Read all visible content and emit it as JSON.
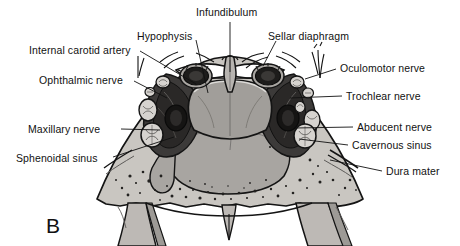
{
  "figure": {
    "panel_letter": "B",
    "colors": {
      "background": "#ffffff",
      "ink": "#111111",
      "bone_light": "#c9c6c1",
      "bone_mid": "#b2aeaa",
      "cavity_shade": "#9d9a96",
      "soft_tissue": "#8e8b88",
      "sinus_dark": "#3c3a39",
      "artery_dark": "#1d1c1b",
      "nerve_fill": "#d6d3cf"
    }
  },
  "labels": [
    {
      "id": "infundibulum",
      "text": "Infundibulum",
      "side": "top",
      "text_x": 196,
      "text_y": 6,
      "leader": [
        [
          230,
          22
        ],
        [
          230,
          72
        ]
      ]
    },
    {
      "id": "hypophysis",
      "text": "Hypophysis",
      "side": "top-left",
      "text_x": 137,
      "text_y": 30,
      "leader": [
        [
          196,
          40
        ],
        [
          208,
          93
        ]
      ]
    },
    {
      "id": "sellar-diaphragm",
      "text": "Sellar diaphragm",
      "side": "top-right",
      "text_x": 268,
      "text_y": 30,
      "leader": [
        [
          276,
          41
        ],
        [
          263,
          66
        ]
      ]
    },
    {
      "id": "internal-carotid-artery",
      "text": "Internal carotid artery",
      "side": "left",
      "text_x": 29,
      "text_y": 44,
      "leader": [
        [
          140,
          51
        ],
        [
          196,
          84
        ]
      ]
    },
    {
      "id": "ophthalmic-nerve",
      "text": "Ophthalmic nerve",
      "side": "left",
      "text_x": 39,
      "text_y": 74,
      "leader": [
        [
          134,
          81
        ],
        [
          167,
          98
        ]
      ]
    },
    {
      "id": "oculomotor-nerve",
      "text": "Oculomotor nerve",
      "side": "right",
      "text_x": 340,
      "text_y": 62,
      "leader": [
        [
          336,
          69
        ],
        [
          305,
          79
        ]
      ]
    },
    {
      "id": "trochlear-nerve",
      "text": "Trochlear nerve",
      "side": "right",
      "text_x": 346,
      "text_y": 90,
      "leader": [
        [
          342,
          96
        ],
        [
          290,
          98
        ]
      ]
    },
    {
      "id": "maxillary-nerve",
      "text": "Maxillary nerve",
      "side": "left",
      "text_x": 28,
      "text_y": 123,
      "leader": [
        [
          121,
          129
        ],
        [
          160,
          130
        ]
      ]
    },
    {
      "id": "abducent-nerve",
      "text": "Abducent nerve",
      "side": "right",
      "text_x": 357,
      "text_y": 121,
      "leader": [
        [
          353,
          127
        ],
        [
          295,
          128
        ]
      ]
    },
    {
      "id": "cavernous-sinus",
      "text": "Cavernous sinus",
      "side": "right",
      "text_x": 352,
      "text_y": 139,
      "leader": [
        [
          348,
          145
        ],
        [
          299,
          139
        ]
      ]
    },
    {
      "id": "sphenoidal-sinus",
      "text": "Sphenoidal sinus",
      "side": "left",
      "text_x": 16,
      "text_y": 152,
      "leader": [
        [
          113,
          157
        ],
        [
          174,
          137
        ]
      ]
    },
    {
      "id": "dura-mater",
      "text": "Dura mater",
      "side": "right",
      "text_x": 386,
      "text_y": 165,
      "leader": [
        [
          382,
          171
        ],
        [
          330,
          160
        ]
      ]
    }
  ]
}
